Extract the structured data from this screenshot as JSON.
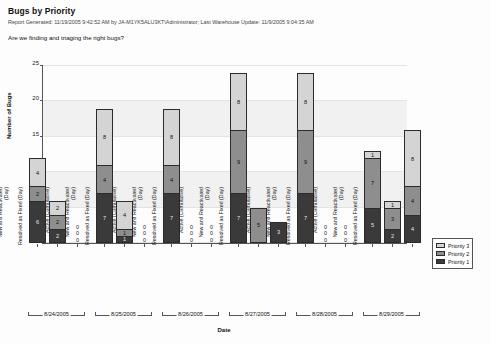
{
  "header": {
    "title": "Bugs by Priority",
    "meta": "Report Generated: 11/19/2005 9:42:52 AM by JA-M1YK5ALU3KT\\Administrator;  Last Warehouse Update: 11/9/2005 9:04:35 AM",
    "question": "Are we finding and triaging the right bugs?"
  },
  "legend": {
    "items": [
      {
        "label": "Priority 3",
        "key": "p3",
        "color": "#d4d4d4"
      },
      {
        "label": "Priority 2",
        "key": "p2",
        "color": "#8e8e8e"
      },
      {
        "label": "Priority 1",
        "key": "p1",
        "color": "#3a3a3a"
      }
    ]
  },
  "chart_data": {
    "type": "bar",
    "subtype": "stacked-grouped-column",
    "title": "Bugs by Priority",
    "xlabel": "Date",
    "ylabel": "Number of Bugs",
    "ylim": [
      0,
      25
    ],
    "yticks": [
      0,
      5,
      10,
      15,
      20,
      25
    ],
    "grid": true,
    "legend_position": "right",
    "categories": [
      "Active (Cumulative)",
      "New and Reactivated (Day)",
      "Resolved as Fixed (Day)"
    ],
    "groups": [
      "8/24/2005",
      "8/25/2005",
      "8/26/2005",
      "8/27/2005",
      "8/28/2005",
      "8/29/2005"
    ],
    "series": [
      {
        "name": "Priority 1",
        "key": "p1"
      },
      {
        "name": "Priority 2",
        "key": "p2"
      },
      {
        "name": "Priority 3",
        "key": "p3"
      }
    ],
    "bars": [
      {
        "group": "8/24/2005",
        "category": "Active (Cumulative)",
        "p1": 6,
        "p2": 2,
        "p3": 4,
        "total": 12
      },
      {
        "group": "8/24/2005",
        "category": "New and Reactivated (Day)",
        "p1": 2,
        "p2": 2,
        "p3": 2,
        "total": 6
      },
      {
        "group": "8/24/2005",
        "category": "Resolved as Fixed (Day)",
        "p1": 0,
        "p2": 0,
        "p3": 0,
        "total": 0
      },
      {
        "group": "8/25/2005",
        "category": "Active (Cumulative)",
        "p1": 7,
        "p2": 4,
        "p3": 8,
        "total": 19
      },
      {
        "group": "8/25/2005",
        "category": "New and Reactivated (Day)",
        "p1": 1,
        "p2": 1,
        "p3": 4,
        "total": 6
      },
      {
        "group": "8/25/2005",
        "category": "Resolved as Fixed (Day)",
        "p1": 0,
        "p2": 0,
        "p3": 0,
        "total": 0
      },
      {
        "group": "8/26/2005",
        "category": "Active (Cumulative)",
        "p1": 7,
        "p2": 4,
        "p3": 8,
        "total": 19
      },
      {
        "group": "8/26/2005",
        "category": "New and Reactivated (Day)",
        "p1": 0,
        "p2": 0,
        "p3": 0,
        "total": 0
      },
      {
        "group": "8/26/2005",
        "category": "Resolved as Fixed (Day)",
        "p1": 0,
        "p2": 0,
        "p3": 0,
        "total": 0
      },
      {
        "group": "8/27/2005",
        "category": "Active (Cumulative)",
        "p1": 7,
        "p2": 9,
        "p3": 8,
        "total": 24
      },
      {
        "group": "8/27/2005",
        "category": "New and Reactivated (Day)",
        "p1": 0,
        "p2": 5,
        "p3": 0,
        "total": 5
      },
      {
        "group": "8/27/2005",
        "category": "Resolved as Fixed (Day)",
        "p1": 3,
        "p2": 0,
        "p3": 0,
        "total": 3
      },
      {
        "group": "8/28/2005",
        "category": "Active (Cumulative)",
        "p1": 7,
        "p2": 9,
        "p3": 8,
        "total": 24
      },
      {
        "group": "8/28/2005",
        "category": "New and Reactivated (Day)",
        "p1": 0,
        "p2": 0,
        "p3": 0,
        "total": 0
      },
      {
        "group": "8/28/2005",
        "category": "Resolved as Fixed (Day)",
        "p1": 0,
        "p2": 0,
        "p3": 0,
        "total": 0
      },
      {
        "group": "8/29/2005",
        "category": "Active (Cumulative)",
        "p1": 5,
        "p2": 7,
        "p3": 1,
        "total": 13
      },
      {
        "group": "8/29/2005",
        "category": "New and Reactivated (Day)",
        "p1": 2,
        "p2": 3,
        "p3": 1,
        "total": 6
      },
      {
        "group": "8/29/2005",
        "category": "Resolved as Fixed (Day)",
        "p1": 4,
        "p2": 4,
        "p3": 8,
        "total": 16
      }
    ]
  }
}
